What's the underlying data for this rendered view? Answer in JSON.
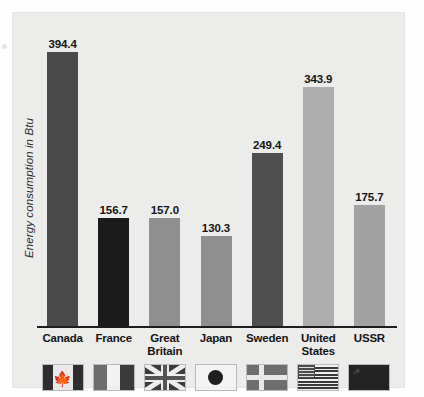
{
  "chart_data": {
    "type": "bar",
    "title": "",
    "xlabel": "",
    "ylabel": "Energy consumption in Btu",
    "ylim": [
      0,
      420
    ],
    "grid": false,
    "legend": "none",
    "categories": [
      "Canada",
      "France",
      "Great Britain",
      "Japan",
      "Sweden",
      "United States",
      "USSR"
    ],
    "values": [
      394.4,
      156.7,
      157.0,
      130.3,
      249.4,
      343.9,
      175.7
    ],
    "value_labels": [
      "394.4",
      "156.7",
      "157.0",
      "130.3",
      "249.4",
      "343.9",
      "175.7"
    ],
    "bar_colors": [
      "#4a4a4a",
      "#1b1b1b",
      "#8f8f8f",
      "#8f8f8f",
      "#4f4f4f",
      "#adadad",
      "#a2a2a2"
    ]
  },
  "axis": {
    "y_title": "Energy consumption in Btu"
  },
  "bars": [
    {
      "country": "Canada",
      "label_lines": [
        "Canada"
      ],
      "value": 394.4,
      "value_label": "394.4",
      "color": "#4a4a4a",
      "flag": "flag-canada"
    },
    {
      "country": "France",
      "label_lines": [
        "France"
      ],
      "value": 156.7,
      "value_label": "156.7",
      "color": "#1b1b1b",
      "flag": "flag-france"
    },
    {
      "country": "Great Britain",
      "label_lines": [
        "Great",
        "Britain"
      ],
      "value": 157.0,
      "value_label": "157.0",
      "color": "#8f8f8f",
      "flag": "flag-great-britain"
    },
    {
      "country": "Japan",
      "label_lines": [
        "Japan"
      ],
      "value": 130.3,
      "value_label": "130.3",
      "color": "#8f8f8f",
      "flag": "flag-japan"
    },
    {
      "country": "Sweden",
      "label_lines": [
        "Sweden"
      ],
      "value": 249.4,
      "value_label": "249.4",
      "color": "#4f4f4f",
      "flag": "flag-sweden"
    },
    {
      "country": "United States",
      "label_lines": [
        "United",
        "States"
      ],
      "value": 343.9,
      "value_label": "343.9",
      "color": "#adadad",
      "flag": "flag-united-states"
    },
    {
      "country": "USSR",
      "label_lines": [
        "USSR"
      ],
      "value": 175.7,
      "value_label": "175.7",
      "color": "#a2a2a2",
      "flag": "flag-ussr"
    }
  ],
  "colors": {
    "panel_background": "#ececeb",
    "page_background": "#fdfdfd",
    "axis_line": "#1d1d1d",
    "text": "#141414"
  },
  "labels": {
    "canada": "Canada",
    "france": "France",
    "great_britain_line1": "Great",
    "great_britain_line2": "Britain",
    "japan": "Japan",
    "sweden": "Sweden",
    "united_states_line1": "United",
    "united_states_line2": "States",
    "ussr": "USSR"
  }
}
